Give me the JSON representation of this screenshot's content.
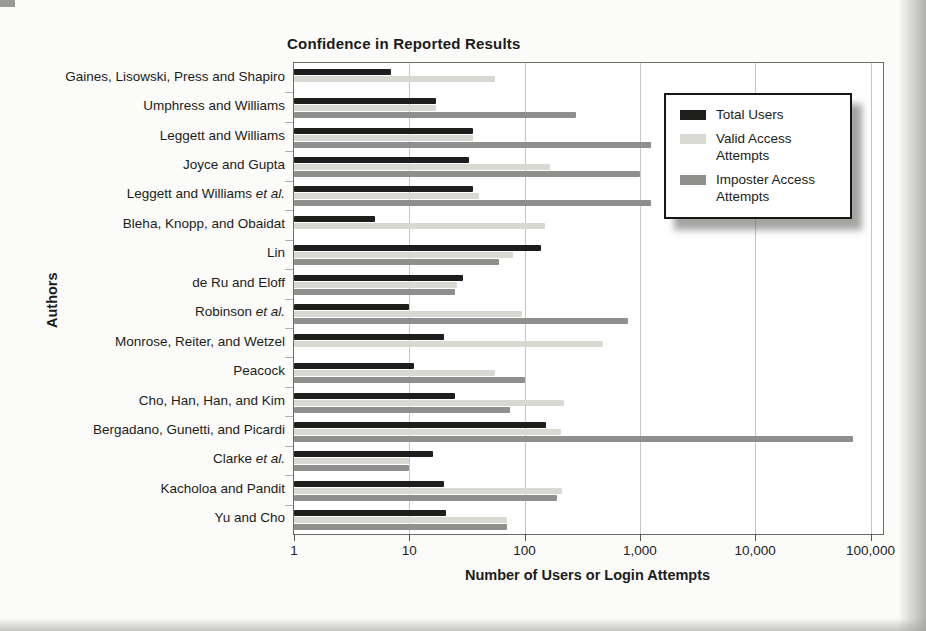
{
  "chart_data": {
    "type": "bar",
    "orientation": "horizontal",
    "title": "Confidence in Reported Results",
    "xlabel": "Number of Users or Login Attempts",
    "ylabel": "Authors",
    "x_scale": "log",
    "xlim": [
      1,
      100000
    ],
    "x_ticks": [
      "1",
      "10",
      "100",
      "1,000",
      "10,000",
      "100,000"
    ],
    "grid": "vertical gridlines at each power of 10",
    "legend_position": "inside plot, upper right",
    "categories": [
      {
        "label": "Gaines, Lisowski, Press and Shapiro",
        "italic_suffix": ""
      },
      {
        "label": "Umphress and Williams",
        "italic_suffix": ""
      },
      {
        "label": "Leggett and Williams",
        "italic_suffix": ""
      },
      {
        "label": "Joyce and Gupta",
        "italic_suffix": ""
      },
      {
        "label": "Leggett and Williams",
        "italic_suffix": "et al."
      },
      {
        "label": "Bleha, Knopp, and Obaidat",
        "italic_suffix": ""
      },
      {
        "label": "Lin",
        "italic_suffix": ""
      },
      {
        "label": "de Ru and Eloff",
        "italic_suffix": ""
      },
      {
        "label": "Robinson",
        "italic_suffix": "et al."
      },
      {
        "label": "Monrose, Reiter, and Wetzel",
        "italic_suffix": ""
      },
      {
        "label": "Peacock",
        "italic_suffix": ""
      },
      {
        "label": "Cho, Han, Han, and Kim",
        "italic_suffix": ""
      },
      {
        "label": "Bergadano, Gunetti, and Picardi",
        "italic_suffix": ""
      },
      {
        "label": "Clarke",
        "italic_suffix": "et al."
      },
      {
        "label": "Kacholoa and Pandit",
        "italic_suffix": ""
      },
      {
        "label": "Yu and Cho",
        "italic_suffix": ""
      }
    ],
    "series": [
      {
        "name": "Total Users",
        "color": "#1e1e1c",
        "values": [
          7,
          17,
          36,
          33,
          36,
          5,
          140,
          29,
          10,
          20,
          11,
          25,
          154,
          16,
          20,
          21
        ]
      },
      {
        "name": "Valid Access Attempts",
        "color": "#d9d9d4",
        "values": [
          55,
          17,
          36,
          165,
          40,
          150,
          80,
          26,
          95,
          480,
          55,
          220,
          205,
          10,
          210,
          70
        ]
      },
      {
        "name": "Imposter Access Attempts",
        "color": "#8f908e",
        "values": [
          null,
          280,
          1260,
          1000,
          1260,
          null,
          60,
          25,
          790,
          null,
          100,
          75,
          70000,
          10,
          190,
          70
        ]
      }
    ]
  },
  "colors": {
    "page_background": "#fbfbf9",
    "plot_background": "#ffffff",
    "bar_total_users": "#1e1e1c",
    "bar_valid_access": "#d9d9d4",
    "bar_imposter_access": "#8f908e",
    "gridline": "#c6c6c3",
    "plot_frame": "#6b6b68",
    "text": "#1b1b1a"
  }
}
